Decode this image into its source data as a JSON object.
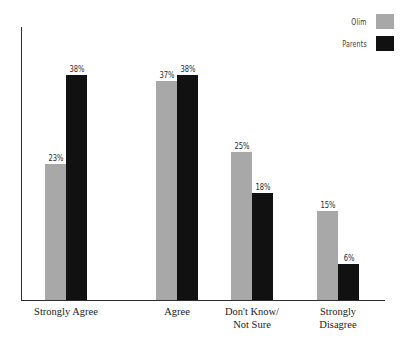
{
  "chart_data": {
    "type": "bar",
    "title": "",
    "subtitle": "",
    "xlabel": "",
    "ylabel": "",
    "ylim": [
      0,
      40
    ],
    "grid": false,
    "legend_position": "top-right",
    "value_label_suffix": "%",
    "categories": [
      "Strongly Agree",
      "Agree",
      "Don't Know/\nNot Sure",
      "Strongly\nDisagree"
    ],
    "series": [
      {
        "name": "Olim",
        "color": "#a8a8a8",
        "values": [
          23,
          37,
          25,
          15
        ],
        "value_labels": [
          "23%",
          "37%",
          "25%",
          "15%"
        ]
      },
      {
        "name": "Parents",
        "color": "#111111",
        "values": [
          38,
          38,
          18,
          6
        ],
        "value_labels": [
          "38%",
          "38%",
          "18%",
          "6%"
        ]
      }
    ]
  },
  "legend": {
    "items": [
      {
        "label": "Olim",
        "swatch_color": "#a8a8a8"
      },
      {
        "label": "Parents",
        "swatch_color": "#111111"
      }
    ]
  },
  "axes": {
    "line_color": "#2e2e2e"
  }
}
